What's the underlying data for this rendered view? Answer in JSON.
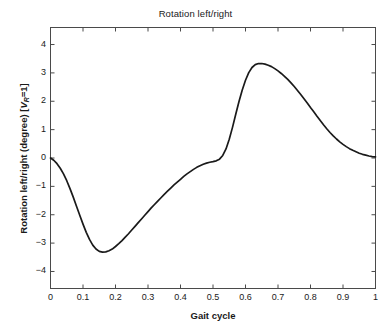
{
  "chart_data": {
    "type": "line",
    "title": "Rotation left/right",
    "xlabel": "Gait cycle",
    "ylabel_prefix": "Rotation left/right (degree) [",
    "ylabel_var": "V",
    "ylabel_sub": "R",
    "ylabel_suffix": "=1]",
    "ylabel_full": "Rotation left/right (degree) [VR=1]",
    "xlim": [
      0,
      1
    ],
    "ylim": [
      -4.6,
      4.6
    ],
    "xticks": [
      0,
      0.1,
      0.2,
      0.3,
      0.4,
      0.5,
      0.6,
      0.7,
      0.8,
      0.9,
      1
    ],
    "xtick_labels": [
      "0",
      "0.1",
      "0.2",
      "0.3",
      "0.4",
      "0.5",
      "0.6",
      "0.7",
      "0.8",
      "0.9",
      "1"
    ],
    "yticks": [
      4,
      3,
      2,
      1,
      0,
      -1,
      -2,
      -3,
      -4
    ],
    "ytick_labels": [
      "4",
      "3",
      "2",
      "1",
      "0",
      "−1",
      "−2",
      "−3",
      "−4"
    ],
    "grid": false,
    "legend": null,
    "line_color": "#1a1a1a",
    "line_width": 1.7,
    "axis_color": "#4a4a4a",
    "background": "#ffffff",
    "series": [
      {
        "name": "Rotation left/right",
        "x": [
          0.0,
          0.01,
          0.02,
          0.03,
          0.04,
          0.05,
          0.06,
          0.07,
          0.08,
          0.09,
          0.1,
          0.11,
          0.12,
          0.13,
          0.14,
          0.15,
          0.16,
          0.17,
          0.18,
          0.19,
          0.2,
          0.21,
          0.22,
          0.23,
          0.24,
          0.25,
          0.26,
          0.27,
          0.28,
          0.29,
          0.3,
          0.31,
          0.32,
          0.33,
          0.34,
          0.35,
          0.36,
          0.37,
          0.38,
          0.39,
          0.4,
          0.41,
          0.42,
          0.43,
          0.44,
          0.45,
          0.46,
          0.47,
          0.48,
          0.49,
          0.5,
          0.51,
          0.52,
          0.53,
          0.54,
          0.55,
          0.56,
          0.57,
          0.58,
          0.59,
          0.6,
          0.61,
          0.62,
          0.63,
          0.64,
          0.65,
          0.66,
          0.67,
          0.68,
          0.69,
          0.7,
          0.71,
          0.72,
          0.73,
          0.74,
          0.75,
          0.76,
          0.77,
          0.78,
          0.79,
          0.8,
          0.81,
          0.82,
          0.83,
          0.84,
          0.85,
          0.86,
          0.87,
          0.88,
          0.89,
          0.9,
          0.91,
          0.92,
          0.93,
          0.94,
          0.95,
          0.96,
          0.97,
          0.98,
          0.99,
          1.0
        ],
        "y": [
          0.0,
          -0.08,
          -0.2,
          -0.36,
          -0.56,
          -0.8,
          -1.08,
          -1.38,
          -1.7,
          -2.02,
          -2.33,
          -2.62,
          -2.87,
          -3.07,
          -3.21,
          -3.29,
          -3.32,
          -3.31,
          -3.27,
          -3.21,
          -3.12,
          -3.02,
          -2.91,
          -2.79,
          -2.67,
          -2.54,
          -2.41,
          -2.28,
          -2.15,
          -2.02,
          -1.89,
          -1.76,
          -1.64,
          -1.52,
          -1.4,
          -1.28,
          -1.17,
          -1.06,
          -0.95,
          -0.85,
          -0.75,
          -0.65,
          -0.56,
          -0.48,
          -0.4,
          -0.33,
          -0.27,
          -0.22,
          -0.18,
          -0.15,
          -0.13,
          -0.1,
          -0.04,
          0.09,
          0.32,
          0.66,
          1.08,
          1.54,
          1.99,
          2.4,
          2.74,
          3.01,
          3.19,
          3.29,
          3.33,
          3.33,
          3.31,
          3.27,
          3.22,
          3.15,
          3.07,
          2.98,
          2.88,
          2.77,
          2.65,
          2.52,
          2.38,
          2.24,
          2.09,
          1.94,
          1.78,
          1.63,
          1.47,
          1.32,
          1.17,
          1.03,
          0.9,
          0.78,
          0.67,
          0.57,
          0.48,
          0.4,
          0.33,
          0.27,
          0.22,
          0.17,
          0.13,
          0.1,
          0.07,
          0.05,
          0.04
        ],
        "color": "#1a1a1a"
      }
    ],
    "annotations": {
      "minimum": {
        "x": 0.16,
        "y": -3.32
      },
      "maximum": {
        "x": 0.645,
        "y": 3.33
      },
      "start": {
        "x": 0.0,
        "y": 0.0
      },
      "end": {
        "x": 1.0,
        "y": 0.04
      },
      "shoulder": {
        "x": 0.5,
        "y": -0.13
      }
    }
  }
}
